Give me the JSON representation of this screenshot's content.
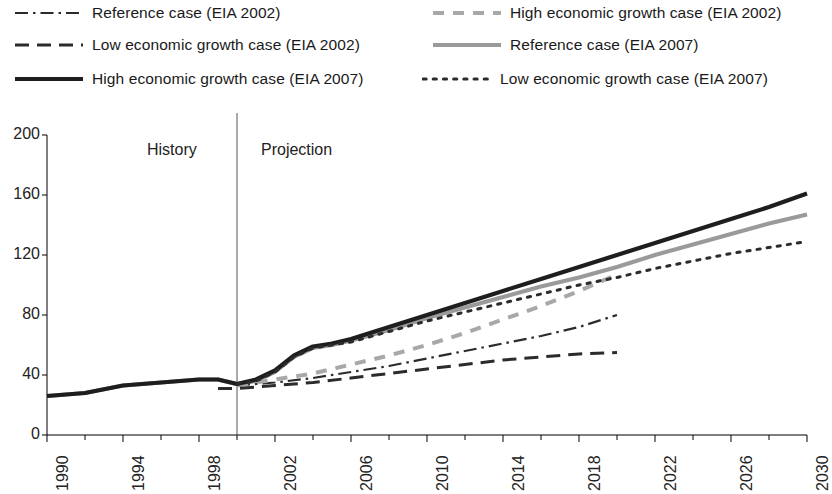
{
  "legend": {
    "items": [
      {
        "label": "Reference case (EIA 2002)",
        "style": "dash-dot",
        "color": "#2b2b2b",
        "width": 2.2
      },
      {
        "label": "High economic growth case (EIA 2002)",
        "style": "dash-light",
        "color": "#a8a8a8",
        "width": 4.0
      },
      {
        "label": "Low economic growth case (EIA 2002)",
        "style": "dash-long",
        "color": "#2b2b2b",
        "width": 3.0
      },
      {
        "label": "Reference case (EIA 2007)",
        "style": "solid-gray",
        "color": "#9a9a9a",
        "width": 4.0
      },
      {
        "label": "High economic growth case (EIA 2007)",
        "style": "solid-black",
        "color": "#1e1e1e",
        "width": 4.2
      },
      {
        "label": "Low economic growth case (EIA 2007)",
        "style": "dotted",
        "color": "#2b2b2b",
        "width": 3.0
      }
    ]
  },
  "annotations": {
    "history": "History",
    "projection": "Projection",
    "divider_year": 2000
  },
  "chart_data": {
    "type": "line",
    "title": "",
    "xlabel": "",
    "ylabel": "",
    "xlim": [
      1990,
      2030
    ],
    "ylim": [
      0,
      200
    ],
    "ytick_values": [
      0,
      40,
      80,
      120,
      160,
      200
    ],
    "xtick_labels": [
      "1990",
      "1994",
      "1998",
      "2002",
      "2006",
      "2010",
      "2014",
      "2018",
      "2022",
      "2026",
      "2030"
    ],
    "xtick_values": [
      1990,
      1994,
      1998,
      2002,
      2006,
      2010,
      2014,
      2018,
      2022,
      2026,
      2030
    ],
    "xminor_step": 2,
    "grid": false,
    "legend_position": "above",
    "series": [
      {
        "name": "Reference case (EIA 2002)",
        "style": "dash-dot",
        "color": "#2b2b2b",
        "width": 2.2,
        "x": [
          2000,
          2001,
          2002,
          2004,
          2006,
          2008,
          2010,
          2012,
          2014,
          2016,
          2018,
          2020
        ],
        "y": [
          33,
          34,
          35,
          38,
          42,
          46,
          51,
          56,
          61,
          66,
          72,
          80
        ]
      },
      {
        "name": "High economic growth case (EIA 2002)",
        "style": "dash-light",
        "color": "#a8a8a8",
        "width": 4.0,
        "x": [
          2000,
          2001,
          2002,
          2004,
          2006,
          2008,
          2010,
          2012,
          2014,
          2016,
          2018,
          2020
        ],
        "y": [
          33,
          35,
          37,
          41,
          47,
          53,
          60,
          68,
          77,
          86,
          96,
          107
        ]
      },
      {
        "name": "Low economic growth case (EIA 2002)",
        "style": "dash-long",
        "color": "#2b2b2b",
        "width": 3.0,
        "x": [
          1999,
          2000,
          2001,
          2002,
          2004,
          2006,
          2008,
          2010,
          2012,
          2014,
          2016,
          2018,
          2020
        ],
        "y": [
          31,
          31,
          32,
          33,
          35,
          38,
          41,
          44,
          47,
          50,
          52,
          54,
          55
        ]
      },
      {
        "name": "Reference case (EIA 2007)",
        "style": "solid-gray",
        "color": "#9a9a9a",
        "width": 4.0,
        "x": [
          1990,
          1992,
          1994,
          1996,
          1998,
          1999,
          2000,
          2001,
          2002,
          2003,
          2004,
          2005,
          2006,
          2008,
          2010,
          2012,
          2014,
          2016,
          2018,
          2020,
          2022,
          2024,
          2026,
          2028,
          2030
        ],
        "y": [
          26,
          28,
          33,
          35,
          37,
          37,
          34,
          36,
          42,
          52,
          58,
          60,
          63,
          70,
          78,
          85,
          92,
          99,
          105,
          112,
          120,
          127,
          134,
          141,
          147
        ]
      },
      {
        "name": "High economic growth case (EIA 2007)",
        "style": "solid-black",
        "color": "#1e1e1e",
        "width": 4.2,
        "x": [
          1990,
          1992,
          1994,
          1996,
          1998,
          1999,
          2000,
          2001,
          2002,
          2003,
          2004,
          2005,
          2006,
          2008,
          2010,
          2012,
          2014,
          2016,
          2018,
          2020,
          2022,
          2024,
          2026,
          2028,
          2030
        ],
        "y": [
          26,
          28,
          33,
          35,
          37,
          37,
          34,
          37,
          43,
          53,
          59,
          61,
          64,
          72,
          80,
          88,
          96,
          104,
          112,
          120,
          128,
          136,
          144,
          152,
          161
        ]
      },
      {
        "name": "Low economic growth case (EIA 2007)",
        "style": "dotted",
        "color": "#2b2b2b",
        "width": 3.0,
        "x": [
          2000,
          2001,
          2002,
          2003,
          2004,
          2005,
          2006,
          2008,
          2010,
          2012,
          2014,
          2016,
          2018,
          2020,
          2022,
          2024,
          2026,
          2028,
          2030
        ],
        "y": [
          34,
          36,
          42,
          52,
          58,
          60,
          62,
          69,
          76,
          82,
          88,
          94,
          100,
          105,
          111,
          116,
          121,
          125,
          129
        ]
      }
    ]
  }
}
